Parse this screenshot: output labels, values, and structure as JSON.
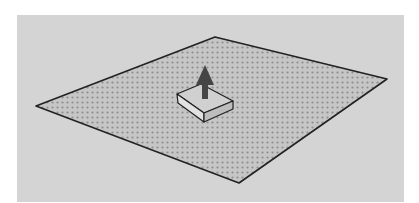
{
  "figure": {
    "colors": {
      "page_background": "#ffffff",
      "canvas_background": "#d4d4d4",
      "plane_fill": "#c6c6c6",
      "plane_dots": "#8e8e8e",
      "outline": "#222222",
      "box_top": "#d0d0d0",
      "box_front": "#e2e2e2",
      "box_side": "#bdbdbd",
      "arrow": "#454545"
    },
    "canvas": {
      "x": 17,
      "y": 15,
      "width": 387,
      "height": 187
    },
    "plane": {
      "points": [
        [
          36,
          106
        ],
        [
          215,
          37
        ],
        [
          387,
          79
        ],
        [
          239,
          183
        ]
      ]
    },
    "box": {
      "top_face": [
        [
          177,
          94
        ],
        [
          201,
          84
        ],
        [
          233,
          101
        ],
        [
          204,
          113
        ]
      ],
      "left_face": [
        [
          177,
          94
        ],
        [
          204,
          113
        ],
        [
          204,
          122
        ],
        [
          178,
          103
        ]
      ],
      "right_face": [
        [
          204,
          113
        ],
        [
          233,
          101
        ],
        [
          233,
          109
        ],
        [
          204,
          122
        ]
      ]
    },
    "arrow": {
      "points": [
        [
          205,
          65
        ],
        [
          214,
          85
        ],
        [
          208,
          85
        ],
        [
          208,
          99
        ],
        [
          202,
          99
        ],
        [
          202,
          85
        ],
        [
          196,
          85
        ]
      ]
    }
  }
}
